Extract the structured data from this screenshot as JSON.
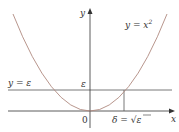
{
  "diagram": {
    "curve_label_lhs": "y = x",
    "curve_label_exp": "2",
    "line_label": "y = ε",
    "y_axis_label": "y",
    "x_axis_label": "x",
    "epsilon_tick": "ε",
    "origin_label": "0",
    "delta_label_lhs": "δ = ",
    "delta_label_rad": "√",
    "delta_label_eps": "ε",
    "colors": {
      "curve": "#b08a80",
      "axes": "#333333",
      "lines": "#555555"
    }
  }
}
